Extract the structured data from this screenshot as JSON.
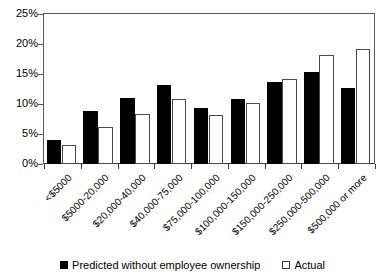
{
  "chart_data": {
    "type": "bar",
    "title": "",
    "subtitle": "",
    "xlabel": "",
    "ylabel": "",
    "ylim": [
      0,
      25
    ],
    "yticks": [
      0,
      5,
      10,
      15,
      20,
      25
    ],
    "ytick_labels": [
      "0%",
      "5%",
      "10%",
      "15%",
      "20%",
      "25%"
    ],
    "grid": false,
    "legend_position": "bottom",
    "categories": [
      "<$5000",
      "$5000-20,000",
      "$20,000-40,000",
      "$40,000-75,000",
      "$75,000-100,000",
      "$100,000-150,000",
      "$150,000-250,000",
      "$250,000-500,000",
      "$500,000 or more"
    ],
    "series": [
      {
        "name": "Predicted without employee ownership",
        "color": "#000000",
        "style": "filled",
        "values": [
          4.0,
          8.9,
          11.0,
          13.1,
          9.4,
          10.8,
          13.6,
          15.3,
          12.7
        ]
      },
      {
        "name": "Actual",
        "color": "#ffffff",
        "style": "hollow",
        "values": [
          3.2,
          6.2,
          8.4,
          10.9,
          8.2,
          10.1,
          14.2,
          18.2,
          19.1
        ]
      }
    ],
    "annotations": []
  },
  "legend": {
    "items": [
      {
        "label": "Predicted without employee ownership",
        "marker": "filled-square-icon"
      },
      {
        "label": "Actual",
        "marker": "hollow-square-icon"
      }
    ]
  }
}
